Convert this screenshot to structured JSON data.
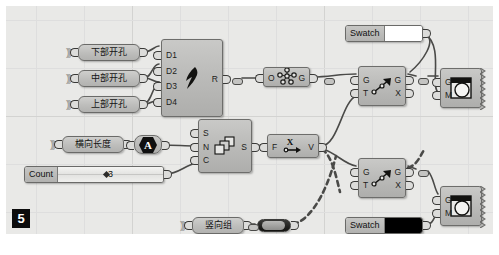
{
  "app": {
    "name": "Grasshopper Canvas",
    "figure_marker": "5",
    "canvas_bg": "#e9e9e7",
    "node_fill": "#bdbdbb",
    "node_border": "#6d6d6b",
    "wire_color": "#4a4a48"
  },
  "params": [
    {
      "id": "p_lower_hole",
      "label": "下部开孔",
      "x": 72,
      "y": 38,
      "w": 62,
      "kind": "geometry-param"
    },
    {
      "id": "p_middle_hole",
      "label": "中部开孔",
      "x": 72,
      "y": 64,
      "w": 62,
      "kind": "geometry-param"
    },
    {
      "id": "p_upper_hole",
      "label": "上部开孔",
      "x": 72,
      "y": 90,
      "w": 62,
      "kind": "geometry-param"
    },
    {
      "id": "p_horiz_len",
      "label": "横向长度",
      "x": 56,
      "y": 130,
      "w": 62,
      "kind": "number-param"
    },
    {
      "id": "p_vert_group",
      "label": "竖向组",
      "x": 186,
      "y": 211,
      "w": 52,
      "kind": "geometry-param"
    }
  ],
  "slider": {
    "id": "s_count",
    "label": "Count",
    "value": "3",
    "x": 18,
    "y": 160,
    "w": 140
  },
  "swatches": [
    {
      "id": "sw_top",
      "label": "Swatch",
      "color": "#ffffff",
      "x": 339,
      "y": 19,
      "w": 78
    },
    {
      "id": "sw_bottom",
      "label": "Swatch",
      "color": "#000000",
      "x": 339,
      "y": 211,
      "w": 78
    }
  ],
  "toggle": {
    "id": "t_boolean",
    "x": 251,
    "y": 213,
    "w": 34,
    "state": "on"
  },
  "components": [
    {
      "id": "c_cluster",
      "icon": "cluster-bird-icon",
      "x": 155,
      "y": 33,
      "w": 62,
      "h": 78,
      "inputs": [
        "D1",
        "D2",
        "D3",
        "D4"
      ],
      "outputs": [
        "R"
      ]
    },
    {
      "id": "c_series",
      "icon": "series-cards-icon",
      "x": 192,
      "y": 113,
      "w": 54,
      "h": 54,
      "inputs": [
        "S",
        "N",
        "C"
      ],
      "outputs": [
        "S"
      ]
    },
    {
      "id": "c_graft",
      "icon": "point-cloud-icon",
      "x": 257,
      "y": 61,
      "w": 47,
      "h": 20,
      "inputs": [
        "O"
      ],
      "outputs": [
        "G"
      ]
    },
    {
      "id": "c_evaluate",
      "icon": "x-arrow-icon",
      "x": 261,
      "y": 128,
      "w": 52,
      "h": 24,
      "inputs": [
        "F"
      ],
      "outputs": [
        "V"
      ]
    },
    {
      "id": "c_transform_top",
      "icon": "transform-arrow-icon",
      "x": 352,
      "y": 60,
      "w": 48,
      "h": 40,
      "inputs": [
        "G",
        "T"
      ],
      "outputs": [
        "G",
        "X"
      ]
    },
    {
      "id": "c_transform_bottom",
      "icon": "transform-arrow-icon",
      "x": 352,
      "y": 152,
      "w": 48,
      "h": 40,
      "inputs": [
        "G",
        "T"
      ],
      "outputs": [
        "G",
        "X"
      ]
    },
    {
      "id": "c_preview_top",
      "icon": "custom-preview-icon",
      "x": 434,
      "y": 62,
      "w": 42,
      "h": 40,
      "inputs": [
        "G",
        "M"
      ],
      "outputs": []
    },
    {
      "id": "c_preview_bottom",
      "icon": "custom-preview-icon",
      "x": 434,
      "y": 180,
      "w": 42,
      "h": 40,
      "inputs": [
        "G",
        "M"
      ],
      "outputs": []
    }
  ],
  "relays": [
    {
      "id": "r_1",
      "x": 226,
      "y": 72
    },
    {
      "id": "r_2",
      "x": 318,
      "y": 72
    },
    {
      "id": "r_3",
      "x": 412,
      "y": 72
    },
    {
      "id": "r_4",
      "x": 412,
      "y": 164
    },
    {
      "id": "r_5",
      "x": 242,
      "y": 218
    }
  ],
  "wires": {
    "style_solid": "solid",
    "style_dashed": "dashed",
    "paths": [
      {
        "id": "w_lower_to_d1",
        "d": "M138 46 C146 46 148 40 153 40",
        "style": "solid"
      },
      {
        "id": "w_mid_to_d2",
        "d": "M138 72 C146 72 146 58 153 58",
        "style": "solid"
      },
      {
        "id": "w_mid_to_d3",
        "d": "M138 72 C146 72 147 76 153 76",
        "style": "solid"
      },
      {
        "id": "w_upper_to_d4",
        "d": "M138 98 C146 98 147 94 153 94",
        "style": "solid"
      },
      {
        "id": "w_upper_to_d3b",
        "d": "M138 98 C146 96 147 78 153 76",
        "style": "solid"
      },
      {
        "id": "w_r_to_relay",
        "d": "M219 72 L224 72",
        "style": "solid"
      },
      {
        "id": "w_relay_to_o",
        "d": "M236 72 L255 72",
        "style": "solid"
      },
      {
        "id": "w_a_to_n",
        "d": "M156 139 C170 139 178 140 190 140",
        "style": "solid"
      },
      {
        "id": "w_len_to_a",
        "d": "M120 138 C126 138 128 138 134 138",
        "style": "solid"
      },
      {
        "id": "w_count_to_c",
        "d": "M160 168 C172 168 178 160 190 157",
        "style": "solid"
      },
      {
        "id": "w_s_to_f",
        "d": "M248 140 L259 140",
        "style": "solid"
      },
      {
        "id": "w_g_to_gt_top",
        "d": "M306 71 C324 71 332 68 350 68",
        "style": "solid"
      },
      {
        "id": "w_v_to_gt_top",
        "d": "M315 140 C332 140 336 96 350 90",
        "style": "solid"
      },
      {
        "id": "w_v_to_gt_bot",
        "d": "M315 142 C332 148 338 158 350 160",
        "style": "solid"
      },
      {
        "id": "w_swtop_down",
        "d": "M419 28 C432 34 416 56 404 66",
        "style": "solid"
      },
      {
        "id": "w_gtop_relay",
        "d": "M402 68 L410 70",
        "style": "solid"
      },
      {
        "id": "w_relay_prev",
        "d": "M422 70 L432 70",
        "style": "solid"
      },
      {
        "id": "w_sw_to_m_top",
        "d": "M419 28 C438 40 424 80 432 86",
        "style": "solid"
      },
      {
        "id": "w_gbot_relay",
        "d": "M402 160 L410 163",
        "style": "solid"
      },
      {
        "id": "w_relay_pbot",
        "d": "M422 165 C428 172 428 182 432 188",
        "style": "solid"
      },
      {
        "id": "w_swbot_to_m",
        "d": "M419 220 C428 218 428 210 432 206",
        "style": "solid"
      },
      {
        "id": "w_vert_toggle",
        "d": "M241 218 L249 218",
        "style": "solid"
      },
      {
        "id": "w_toggle_up",
        "d": "M287 218 C300 216 318 196 330 150",
        "style": "dashed"
      },
      {
        "id": "w_dash_mid",
        "d": "M316 143 C326 150 330 170 334 186",
        "style": "dashed"
      },
      {
        "id": "w_dash_gx",
        "d": "M402 162 C412 158 414 150 418 144",
        "style": "dashed"
      }
    ]
  }
}
